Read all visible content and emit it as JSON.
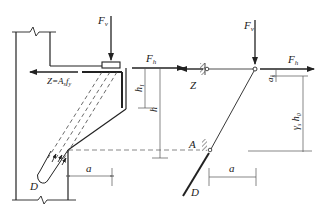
{
  "diagram": {
    "type": "corbel strut-and-tie model",
    "left_panel": {
      "labels": {
        "vertical_force": "F",
        "vertical_force_sub": "v",
        "horizontal_force": "F",
        "horizontal_force_sub": "h",
        "tie": "Z=A",
        "tie_sub_s": "s",
        "tie_f": "f",
        "tie_sub_y": "y",
        "h1": "h",
        "h1_sub": "1",
        "h": "h",
        "strut": "D",
        "lever": "a"
      }
    },
    "right_panel": {
      "labels": {
        "vertical_force": "F",
        "vertical_force_sub": "v",
        "horizontal_force": "F",
        "horizontal_force_sub": "h",
        "tie": "Z",
        "node": "A",
        "strut": "D",
        "lever": "a",
        "as": "a",
        "as_sub": "s",
        "gamma": "γ",
        "gamma_sub": "s",
        "h0": "h",
        "h0_sub": "0"
      }
    },
    "colors": {
      "line": "#222222",
      "dim": "#555555"
    }
  }
}
